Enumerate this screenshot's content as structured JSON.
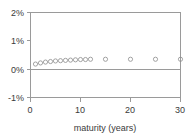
{
  "chart_data": {
    "type": "scatter",
    "title": "",
    "subtitle": "",
    "xlabel": "maturity (years)",
    "ylabel": "",
    "xlim": [
      0,
      30
    ],
    "ylim": [
      -1,
      2
    ],
    "x_ticks": [
      0,
      10,
      20,
      30
    ],
    "x_tick_labels": [
      "0",
      "10",
      "20",
      "30"
    ],
    "y_ticks": [
      -1,
      0,
      1,
      2
    ],
    "y_tick_labels": [
      "-1%",
      "0%",
      "1%",
      "2%"
    ],
    "grid": false,
    "legend": "none",
    "zero_line": 0,
    "marker": "open-circle",
    "marker_color": "#8d8d8d",
    "series": [
      {
        "name": "spread",
        "x": [
          1,
          2,
          3,
          4,
          5,
          6,
          7,
          8,
          9,
          10,
          11,
          12,
          15,
          20,
          25,
          30
        ],
        "values": [
          0.18,
          0.22,
          0.25,
          0.27,
          0.29,
          0.3,
          0.31,
          0.32,
          0.33,
          0.34,
          0.34,
          0.35,
          0.35,
          0.35,
          0.35,
          0.35
        ]
      }
    ]
  },
  "axis": {
    "x_title": "maturity (years)",
    "y_unit": "%"
  }
}
